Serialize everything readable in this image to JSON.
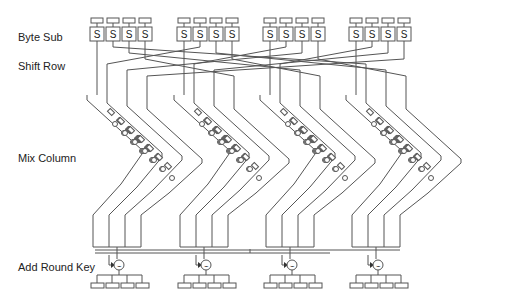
{
  "diagram": {
    "stages": [
      {
        "id": "byte-sub",
        "label": "Byte Sub"
      },
      {
        "id": "shift-row",
        "label": "Shift Row"
      },
      {
        "id": "mix-column",
        "label": "Mix Column"
      },
      {
        "id": "add-round-key",
        "label": "Add Round Key"
      }
    ],
    "sbox_glyph": "S",
    "groups": 4,
    "sboxes_per_group": 4,
    "xor_symbol": "⊻",
    "colors": {
      "line": "#555555",
      "text": "#222222",
      "background": "#ffffff"
    }
  }
}
